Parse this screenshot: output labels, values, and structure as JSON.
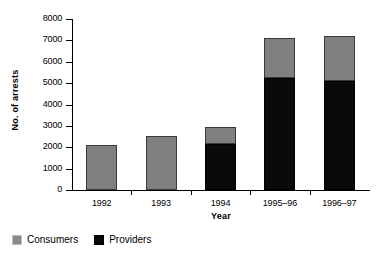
{
  "chart_data": {
    "type": "bar",
    "subtype": "stacked-vertical",
    "title": "",
    "xlabel": "Year",
    "ylabel": "No. of arrests",
    "categories": [
      "1992",
      "1993",
      "1994",
      "1995–96",
      "1996–97"
    ],
    "ylim": [
      0,
      8000
    ],
    "yticks": [
      0,
      1000,
      2000,
      3000,
      4000,
      5000,
      6000,
      7000,
      8000
    ],
    "ytick_labels": [
      "0",
      "1000",
      "2000",
      "3000",
      "4000",
      "5000",
      "6000",
      "7000",
      "8000"
    ],
    "grid": false,
    "legend_position": "below-left",
    "series": [
      {
        "name": "Providers",
        "color": "#0a0a0a",
        "values": [
          0,
          0,
          2150,
          5250,
          5100
        ]
      },
      {
        "name": "Consumers",
        "color": "#808080",
        "values": [
          2120,
          2550,
          800,
          1870,
          2100
        ]
      }
    ],
    "totals": [
      2120,
      2550,
      2950,
      7120,
      7200
    ]
  },
  "axes": {
    "y_title": "No. of arrests",
    "x_title": "Year"
  },
  "legend": {
    "items": [
      {
        "label": "Consumers",
        "color": "#808080"
      },
      {
        "label": "Providers",
        "color": "#0a0a0a"
      }
    ]
  }
}
